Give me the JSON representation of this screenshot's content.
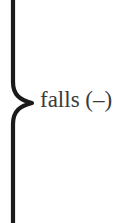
{
  "diagram": {
    "brace": {
      "direction": "right",
      "color": "#1a1a1a"
    },
    "label": "falls (–)"
  }
}
